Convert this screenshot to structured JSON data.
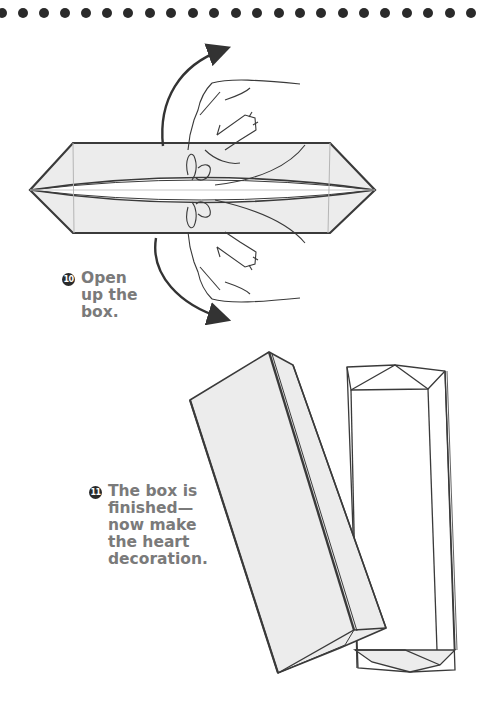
{
  "page": {
    "decoration": {
      "dot_count": 22,
      "dot_color": "#2a2a2a"
    },
    "steps": [
      {
        "number": "10",
        "text": "Open\nup the\nbox."
      },
      {
        "number": "11",
        "text": "The box is\nfinished—\nnow make\nthe heart\ndecoration."
      }
    ],
    "colors": {
      "paper_fill": "#ececec",
      "line": "#3a3a3a",
      "text": "#7a7a7a",
      "badge": "#2a2a2a"
    },
    "illustrations": [
      {
        "name": "flattened-box-with-hands",
        "caption_step": "10"
      },
      {
        "name": "finished-box-and-lid",
        "caption_step": "11"
      }
    ]
  }
}
